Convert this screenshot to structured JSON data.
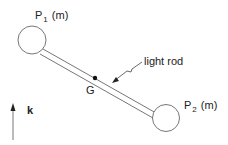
{
  "diagram": {
    "particle1": {
      "name": "P",
      "subscript": "1",
      "mass": "(m)"
    },
    "particle2": {
      "name": "P",
      "subscript": "2",
      "mass": "(m)"
    },
    "center_label": "G",
    "rod_label": "light rod",
    "axis_label": "k",
    "colors": {
      "stroke": "#555555",
      "text": "#222222",
      "background": "#ffffff"
    }
  }
}
